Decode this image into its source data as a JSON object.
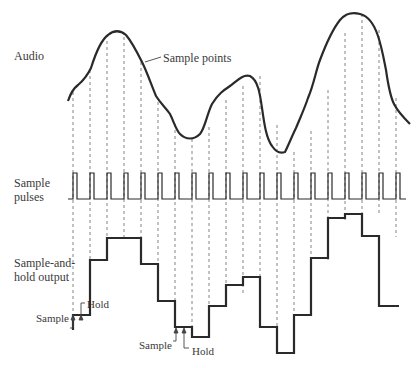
{
  "labels": {
    "audio": "Audio",
    "sample_points": "Sample points",
    "sample_pulses_1": "Sample",
    "sample_pulses_2": "pulses",
    "sh_output_1": "Sample-and-",
    "sh_output_2": "hold output",
    "sample_a": "Sample",
    "hold_a": "Hold",
    "sample_b": "Sample",
    "hold_b": "Hold"
  },
  "colors": {
    "stroke": "#2a2a2a",
    "dashed": "#555555",
    "text": "#3a3a3a"
  },
  "diagram": {
    "sample_x": [
      99,
      116,
      133,
      150,
      167,
      184,
      201,
      218,
      235,
      252,
      269,
      286,
      303,
      320,
      337,
      354,
      371,
      388
    ],
    "audio_y_at_samples": [
      92,
      70,
      41,
      40,
      62,
      102,
      122,
      139,
      135,
      101,
      77,
      117,
      152,
      131,
      90,
      36,
      15,
      36,
      100
    ],
    "hold_levels_y": [
      315,
      316,
      260,
      240,
      240,
      266,
      293,
      328,
      328,
      337,
      306,
      296,
      287,
      327,
      353,
      315,
      260,
      220,
      215,
      237,
      306
    ],
    "pulse_baseline_y": 199,
    "pulse_top_y": 173
  }
}
